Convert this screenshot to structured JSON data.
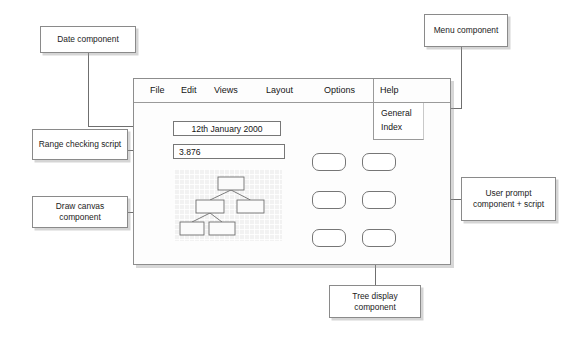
{
  "window": {
    "menubar": {
      "items": [
        {
          "label": "File"
        },
        {
          "label": "Edit"
        },
        {
          "label": "Views"
        },
        {
          "label": "Layout"
        },
        {
          "label": "Options"
        },
        {
          "label": "Help"
        }
      ]
    },
    "help_dropdown": {
      "items": [
        {
          "label": "General"
        },
        {
          "label": "Index"
        }
      ]
    },
    "fields": {
      "date": {
        "value": "12th January 2000",
        "placeholder": "Enter date"
      },
      "number": {
        "value": "3.876",
        "placeholder": "Enter value"
      }
    },
    "canvas": {
      "tree_nodes": [
        {
          "id": "root",
          "x": 44,
          "y": 8,
          "w": 26,
          "h": 13
        },
        {
          "id": "left",
          "x": 22,
          "y": 31,
          "w": 28,
          "h": 13
        },
        {
          "id": "right",
          "x": 63,
          "y": 31,
          "w": 27,
          "h": 13
        },
        {
          "id": "leaf1",
          "x": 6,
          "y": 53,
          "w": 24,
          "h": 13
        },
        {
          "id": "leaf2",
          "x": 35,
          "y": 53,
          "w": 26,
          "h": 13
        }
      ],
      "tree_edges": [
        {
          "from": "root",
          "to": "left"
        },
        {
          "from": "root",
          "to": "right"
        },
        {
          "from": "left",
          "to": "leaf1"
        },
        {
          "from": "left",
          "to": "leaf2"
        }
      ]
    },
    "prompt_buttons": [
      {
        "id": "prompt-btn-1",
        "label": "",
        "x": 178,
        "y": 74
      },
      {
        "id": "prompt-btn-2",
        "label": "",
        "x": 228,
        "y": 74
      },
      {
        "id": "prompt-btn-3",
        "label": "",
        "x": 178,
        "y": 112
      },
      {
        "id": "prompt-btn-4",
        "label": "",
        "x": 228,
        "y": 112
      },
      {
        "id": "prompt-btn-5",
        "label": "",
        "x": 178,
        "y": 150
      },
      {
        "id": "prompt-btn-6",
        "label": "",
        "x": 228,
        "y": 150
      }
    ]
  },
  "callouts": {
    "date": {
      "label": "Date component"
    },
    "range": {
      "label": "Range checking script"
    },
    "draw": {
      "label": "Draw canvas component"
    },
    "menu": {
      "label": "Menu component"
    },
    "prompt": {
      "label": "User prompt component + script"
    },
    "tree": {
      "label": "Tree display component"
    }
  },
  "colors": {
    "line": "#6f6f6f",
    "border": "#8a8a8a",
    "canvas_bg": "#f2f2f2",
    "page_bg": "#ffffff",
    "text": "#1a1a1a"
  }
}
